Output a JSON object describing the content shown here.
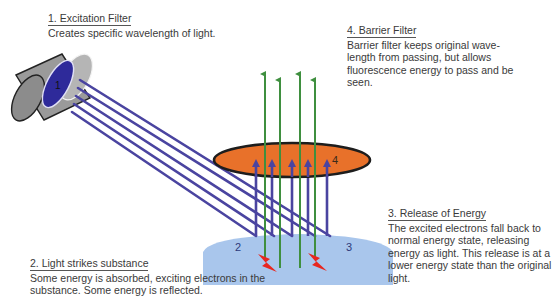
{
  "diagram": {
    "colors": {
      "excitation_light": "#4a44a0",
      "emitted_light": "#3f8f3f",
      "barrier_filter": "#e8712a",
      "substance": "#a9c6ec",
      "spark": "#e8261f",
      "filter_housing": "#9a9a9a",
      "filter_lens": "#2e2a9a"
    },
    "markers": {
      "m1": "1",
      "m2": "2",
      "m3": "3",
      "m4": "4"
    }
  },
  "captions": {
    "excitation_filter": {
      "title": "1. Excitation Filter",
      "body": "Creates specific wavelength of light."
    },
    "light_strikes": {
      "title": "2. Light strikes substance",
      "body": "Some energy is absorbed, exciting electrons in the substance. Some energy is reflected."
    },
    "release_energy": {
      "title": "3. Release of Energy",
      "body": "The excited electrons fall back to normal energy state, releasing energy as light. This release is at a lower energy state than the original light."
    },
    "barrier_filter": {
      "title": "4. Barrier Filter",
      "body": "Barrier filter keeps original wave-length from passing, but allows fluorescence energy to pass and be seen."
    }
  }
}
